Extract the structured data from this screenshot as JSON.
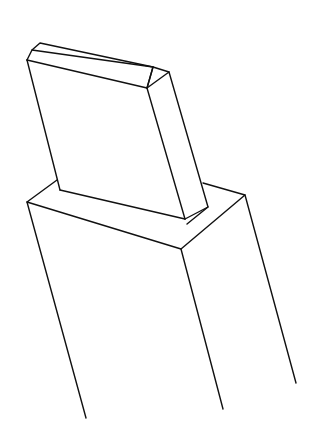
{
  "figure": {
    "stroke_color": "#111111",
    "background": "#ffffff"
  }
}
